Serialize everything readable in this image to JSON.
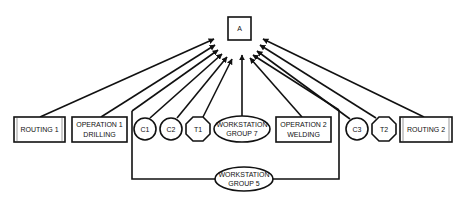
{
  "diagram": {
    "root": {
      "id": "A",
      "label": "A"
    },
    "nodes": [
      {
        "id": "routing1",
        "type": "routing",
        "lines": [
          "ROUTING 1"
        ]
      },
      {
        "id": "op1",
        "type": "operation",
        "lines": [
          "OPERATION  1",
          "DRILLING"
        ]
      },
      {
        "id": "c1",
        "type": "component",
        "lines": [
          "C1"
        ]
      },
      {
        "id": "c2",
        "type": "component",
        "lines": [
          "C2"
        ]
      },
      {
        "id": "t1",
        "type": "tool",
        "lines": [
          "T1"
        ]
      },
      {
        "id": "wsg7",
        "type": "workstation-group",
        "lines": [
          "WORKSTATION",
          "GROUP 7"
        ]
      },
      {
        "id": "op2",
        "type": "operation",
        "lines": [
          "OPERATION 2",
          "WELDING"
        ]
      },
      {
        "id": "c3",
        "type": "component",
        "lines": [
          "C3"
        ]
      },
      {
        "id": "t2",
        "type": "tool",
        "lines": [
          "T2"
        ]
      },
      {
        "id": "routing2",
        "type": "routing",
        "lines": [
          "ROUTING 2"
        ]
      },
      {
        "id": "wsg5",
        "type": "workstation-group",
        "lines": [
          "WORKSTATION",
          "GROUP 5"
        ]
      }
    ],
    "edges": [
      {
        "from": "routing1",
        "to": "A"
      },
      {
        "from": "op1",
        "to": "A"
      },
      {
        "from": "wsg5",
        "to": "A",
        "via": "left-bracket"
      },
      {
        "from": "c1",
        "to": "A"
      },
      {
        "from": "c2",
        "to": "A"
      },
      {
        "from": "t1",
        "to": "A"
      },
      {
        "from": "wsg7",
        "to": "A"
      },
      {
        "from": "op2",
        "to": "A"
      },
      {
        "from": "wsg5",
        "to": "A",
        "via": "right-bracket"
      },
      {
        "from": "c3",
        "to": "A"
      },
      {
        "from": "t2",
        "to": "A"
      },
      {
        "from": "routing2",
        "to": "A"
      }
    ],
    "colors": {
      "stroke": "#111111",
      "background": "#ffffff",
      "routing_inner": "#bbbbbb"
    }
  }
}
